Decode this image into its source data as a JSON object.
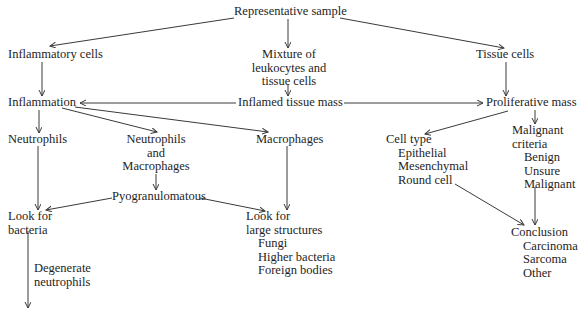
{
  "diagram": {
    "nodes": {
      "representative_sample": "Representative sample",
      "inflammatory_cells": "Inflammatory cells",
      "mixture": [
        "Mixture of",
        "leukocytes and",
        "tissue cells"
      ],
      "tissue_cells": "Tissue cells",
      "inflammation": "Inflammation",
      "inflamed_tissue_mass": "Inflamed tissue mass",
      "proliferative_mass": "Proliferative mass",
      "neutrophils": "Neutrophils",
      "neutrophils_and_macrophages": [
        "Neutrophils",
        "and",
        "Macrophages"
      ],
      "macrophages": "Macrophages",
      "cell_type": {
        "title": "Cell type",
        "items": [
          "Epithelial",
          "Mesenchymal",
          "Round cell"
        ]
      },
      "malignant_criteria": {
        "title": [
          "Malignant",
          "criteria"
        ],
        "items": [
          "Benign",
          "Unsure",
          "Malignant"
        ]
      },
      "pyogranulomatous": "Pyogranulomatous",
      "look_for_bacteria": [
        "Look for",
        "bacteria"
      ],
      "look_for_large_structures": {
        "title": [
          "Look for",
          "large structures"
        ],
        "items": [
          "Fungi",
          "Higher bacteria",
          "Foreign bodies"
        ]
      },
      "conclusion": {
        "title": "Conclusion",
        "items": [
          "Carcinoma",
          "Sarcoma",
          "Other"
        ]
      },
      "degenerate_neutrophils": [
        "Degenerate",
        "neutrophils"
      ]
    },
    "edges": [
      {
        "from": "Representative sample",
        "to": "Inflammatory cells"
      },
      {
        "from": "Representative sample",
        "to": "Mixture of leukocytes and tissue cells"
      },
      {
        "from": "Representative sample",
        "to": "Tissue cells"
      },
      {
        "from": "Inflammatory cells",
        "to": "Inflammation"
      },
      {
        "from": "Mixture of leukocytes and tissue cells",
        "to": "Inflamed tissue mass"
      },
      {
        "from": "Tissue cells",
        "to": "Proliferative mass"
      },
      {
        "from": "Inflamed tissue mass",
        "to": "Inflammation"
      },
      {
        "from": "Inflamed tissue mass",
        "to": "Proliferative mass"
      },
      {
        "from": "Inflammation",
        "to": "Neutrophils"
      },
      {
        "from": "Inflammation",
        "to": "Neutrophils and Macrophages"
      },
      {
        "from": "Inflammation",
        "to": "Macrophages"
      },
      {
        "from": "Proliferative mass",
        "to": "Cell type"
      },
      {
        "from": "Proliferative mass",
        "to": "Malignant criteria"
      },
      {
        "from": "Neutrophils and Macrophages",
        "to": "Pyogranulomatous"
      },
      {
        "from": "Pyogranulomatous",
        "to": "Look for bacteria"
      },
      {
        "from": "Pyogranulomatous",
        "to": "Look for large structures"
      },
      {
        "from": "Neutrophils",
        "to": "Look for bacteria"
      },
      {
        "from": "Macrophages",
        "to": "Look for large structures"
      },
      {
        "from": "Cell type",
        "to": "Conclusion"
      },
      {
        "from": "Malignant criteria",
        "to": "Conclusion"
      },
      {
        "from": "Look for bacteria",
        "to": "(continues below)",
        "label": "Degenerate neutrophils"
      }
    ],
    "colors": {
      "text": "#1e1e1e",
      "lines": "#3a3a3a",
      "background": "#ffffff"
    }
  }
}
